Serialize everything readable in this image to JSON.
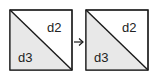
{
  "diagram": {
    "left_square": {
      "top_right_label": "d2",
      "bottom_left_label": "d3"
    },
    "right_square": {
      "top_right_label": "d2",
      "bottom_left_label": "d3"
    },
    "arrow": "→",
    "colors": {
      "stroke": "#1a1a1a",
      "fill_shaded": "#e8e8e8",
      "fill_white": "#ffffff"
    }
  }
}
